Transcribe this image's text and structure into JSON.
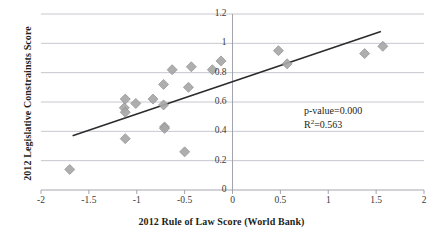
{
  "chart_data": {
    "type": "scatter",
    "title": "",
    "xlabel": "2012 Rule of Law Score (World Bank)",
    "ylabel": "2012 Legislative Constrainsts Score",
    "xlim": [
      -2,
      2
    ],
    "ylim": [
      0,
      1.2
    ],
    "xticks": [
      "-2",
      "-1.5",
      "-1",
      "-0.5",
      "0",
      "0.5",
      "1",
      "1.5",
      "2"
    ],
    "xtick_values": [
      -2,
      -1.5,
      -1,
      -0.5,
      0,
      0.5,
      1,
      1.5,
      2
    ],
    "yticks": [
      "0",
      "0.2",
      "0.4",
      "0.6",
      "0.8",
      "1",
      "1.2"
    ],
    "ytick_values": [
      0,
      0.2,
      0.4,
      0.6,
      0.8,
      1,
      1.2
    ],
    "grid": "horizontal",
    "legend": "none",
    "marker": "diamond",
    "marker_color": "#a8a8a8",
    "marker_edge_color": "#8f8f8f",
    "gridline_color": "#b7b7c4",
    "axis_color": "#9a9aa6",
    "trendline_color": "#2b2b2b",
    "points": [
      {
        "x": -1.7,
        "y": 0.14
      },
      {
        "x": -1.12,
        "y": 0.35
      },
      {
        "x": -1.12,
        "y": 0.62
      },
      {
        "x": -1.13,
        "y": 0.56
      },
      {
        "x": -1.12,
        "y": 0.53
      },
      {
        "x": -1.01,
        "y": 0.59
      },
      {
        "x": -0.83,
        "y": 0.62
      },
      {
        "x": -0.72,
        "y": 0.72
      },
      {
        "x": -0.72,
        "y": 0.58
      },
      {
        "x": -0.71,
        "y": 0.43
      },
      {
        "x": -0.71,
        "y": 0.42
      },
      {
        "x": -0.63,
        "y": 0.82
      },
      {
        "x": -0.5,
        "y": 0.26
      },
      {
        "x": -0.46,
        "y": 0.7
      },
      {
        "x": -0.43,
        "y": 0.84
      },
      {
        "x": -0.21,
        "y": 0.82
      },
      {
        "x": -0.12,
        "y": 0.88
      },
      {
        "x": 0.48,
        "y": 0.95
      },
      {
        "x": 0.57,
        "y": 0.86
      },
      {
        "x": 1.38,
        "y": 0.93
      },
      {
        "x": 1.57,
        "y": 0.98
      }
    ],
    "trendline": {
      "x0": -1.67,
      "y0": 0.37,
      "x1": 1.55,
      "y1": 1.08
    },
    "annotations": {
      "p_value": "p-value=0.000",
      "r_squared_prefix": "R",
      "r_squared_sup": "2",
      "r_squared_value": "=0.563"
    }
  }
}
